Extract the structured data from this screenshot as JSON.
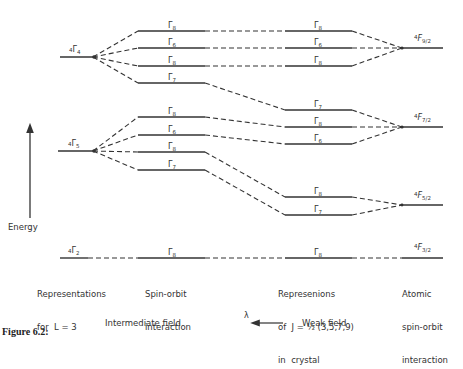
{
  "figure": {
    "caption": "Figure 6.2:"
  },
  "axis": {
    "label": "Energy"
  },
  "columns": {
    "col1": {
      "line1": "Representations",
      "line2": "for  L = 3"
    },
    "col2": {
      "line1": "Spin-orbit",
      "line2": "interaction"
    },
    "col3": {
      "line1": "Represenions",
      "line2": "of  J = ½ (3,5,7,9)",
      "line3": "in  crystal"
    },
    "col4": {
      "line1": "Atomic",
      "line2": "spin-orbit",
      "line3": "interaction"
    }
  },
  "field_axis": {
    "left": "Intermediate field",
    "symbol": "λ",
    "right": "Weak field"
  },
  "levels": {
    "left": [
      {
        "base": "Γ",
        "pre": "4",
        "sub": "4"
      },
      {
        "base": "Γ",
        "pre": "4",
        "sub": "5"
      },
      {
        "base": "Γ",
        "pre": "4",
        "sub": "2"
      }
    ],
    "spin_orbit": [
      "8",
      "6",
      "8",
      "7",
      "8",
      "6",
      "8",
      "7",
      "8"
    ],
    "crystal_J": [
      "8",
      "6",
      "8",
      "7",
      "8",
      "6",
      "8",
      "7",
      "8"
    ],
    "atomic": [
      {
        "base": "F",
        "pre": "4",
        "sub": "9/2"
      },
      {
        "base": "F",
        "pre": "4",
        "sub": "7/2"
      },
      {
        "base": "F",
        "pre": "4",
        "sub": "5/2"
      },
      {
        "base": "F",
        "pre": "4",
        "sub": "3/2"
      }
    ]
  },
  "colors": {
    "ink": "#333333",
    "background": "#ffffff"
  }
}
